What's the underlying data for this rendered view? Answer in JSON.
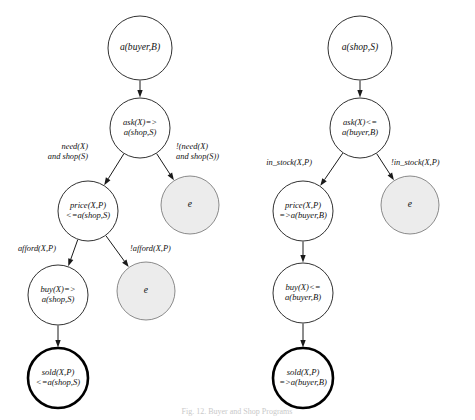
{
  "figure": {
    "caption": "Fig. 12. Buyer and Shop Programs",
    "width": 475,
    "height": 420,
    "background_color": "#ffffff",
    "stroke_color": "#1a1a1a",
    "shaded_fill_color": "#ececec",
    "accept_stroke_color": "#000000"
  },
  "trees": [
    {
      "id": "buyer-tree",
      "name": "buyer-protocol-tree",
      "nodes": [
        {
          "id": "buyer-root",
          "name": "node-a-buyer-b",
          "lines": [
            "a(buyer,B)"
          ],
          "cx": 140,
          "cy": 48,
          "r": 32,
          "style": "plain"
        },
        {
          "id": "buyer-ask",
          "name": "node-ask-x-to-a-shop-s",
          "lines": [
            "ask(X)=>",
            "a(shop,S)"
          ],
          "cx": 140,
          "cy": 128,
          "r": 30,
          "style": "plain"
        },
        {
          "id": "buyer-price",
          "name": "node-price-x-p-from-a-shop-s",
          "lines": [
            "price(X,P)",
            "<=a(shop,S)"
          ],
          "cx": 88,
          "cy": 211,
          "r": 30,
          "style": "plain"
        },
        {
          "id": "buyer-empty-1",
          "name": "node-empty-e-buyer-upper",
          "lines": [
            "e"
          ],
          "cx": 190,
          "cy": 205,
          "r": 29,
          "style": "shaded"
        },
        {
          "id": "buyer-buy",
          "name": "node-buy-x-to-a-shop-s",
          "lines": [
            "buy(X)=>",
            "a(shop,S)"
          ],
          "cx": 58,
          "cy": 295,
          "r": 30,
          "style": "plain"
        },
        {
          "id": "buyer-empty-2",
          "name": "node-empty-e-buyer-lower",
          "lines": [
            "e"
          ],
          "cx": 146,
          "cy": 291,
          "r": 29,
          "style": "shaded"
        },
        {
          "id": "buyer-sold",
          "name": "node-sold-x-p-from-a-shop-s",
          "lines": [
            "sold(X,P)",
            "<=a(shop,S)"
          ],
          "cx": 58,
          "cy": 378,
          "r": 30,
          "style": "accept"
        }
      ],
      "edges": [
        {
          "id": "buyer-e1",
          "name": "edge-root-to-ask",
          "from": "buyer-root",
          "to": "buyer-ask",
          "label_lines": [],
          "label_x": 0,
          "label_y": 0,
          "label_anchor": "middle"
        },
        {
          "id": "buyer-e2",
          "name": "edge-ask-to-price",
          "from": "buyer-ask",
          "to": "buyer-price",
          "label_lines": [
            "need(X)",
            "and shop(S)"
          ],
          "label_x": 88,
          "label_y": 152,
          "label_anchor": "end"
        },
        {
          "id": "buyer-e3",
          "name": "edge-ask-to-empty-1",
          "from": "buyer-ask",
          "to": "buyer-empty-1",
          "label_lines": [
            "!(need(X)",
            "and shop(S))"
          ],
          "label_x": 176,
          "label_y": 152,
          "label_anchor": "start"
        },
        {
          "id": "buyer-e4",
          "name": "edge-price-to-buy",
          "from": "buyer-price",
          "to": "buyer-buy",
          "label_lines": [
            "afford(X,P)"
          ],
          "label_x": 56,
          "label_y": 249,
          "label_anchor": "end"
        },
        {
          "id": "buyer-e5",
          "name": "edge-price-to-empty-2",
          "from": "buyer-price",
          "to": "buyer-empty-2",
          "label_lines": [
            "!afford(X,P)"
          ],
          "label_x": 130,
          "label_y": 249,
          "label_anchor": "start"
        },
        {
          "id": "buyer-e6",
          "name": "edge-buy-to-sold",
          "from": "buyer-buy",
          "to": "buyer-sold",
          "label_lines": [],
          "label_x": 0,
          "label_y": 0,
          "label_anchor": "middle"
        }
      ]
    },
    {
      "id": "shop-tree",
      "name": "shop-protocol-tree",
      "nodes": [
        {
          "id": "shop-root",
          "name": "node-a-shop-s",
          "lines": [
            "a(shop,S)"
          ],
          "cx": 360,
          "cy": 48,
          "r": 32,
          "style": "plain"
        },
        {
          "id": "shop-ask",
          "name": "node-ask-x-from-a-buyer-b",
          "lines": [
            "ask(X)<=",
            "a(buyer,B)"
          ],
          "cx": 360,
          "cy": 128,
          "r": 30,
          "style": "plain"
        },
        {
          "id": "shop-price",
          "name": "node-price-x-p-to-a-buyer-b",
          "lines": [
            "price(X,P)",
            "=>a(buyer,B)"
          ],
          "cx": 303,
          "cy": 211,
          "r": 30,
          "style": "plain"
        },
        {
          "id": "shop-empty-1",
          "name": "node-empty-e-shop",
          "lines": [
            "e"
          ],
          "cx": 410,
          "cy": 205,
          "r": 29,
          "style": "shaded"
        },
        {
          "id": "shop-buy",
          "name": "node-buy-x-from-a-buyer-b",
          "lines": [
            "buy(X)<=",
            "a(buyer,B)"
          ],
          "cx": 303,
          "cy": 293,
          "r": 30,
          "style": "plain"
        },
        {
          "id": "shop-sold",
          "name": "node-sold-x-p-to-a-buyer-b",
          "lines": [
            "sold(X,P)",
            "=>a(buyer,B)"
          ],
          "cx": 303,
          "cy": 378,
          "r": 30,
          "style": "accept"
        }
      ],
      "edges": [
        {
          "id": "shop-e1",
          "name": "edge-root-to-ask",
          "from": "shop-root",
          "to": "shop-ask",
          "label_lines": [],
          "label_x": 0,
          "label_y": 0,
          "label_anchor": "middle"
        },
        {
          "id": "shop-e2",
          "name": "edge-ask-to-price",
          "from": "shop-ask",
          "to": "shop-price",
          "label_lines": [
            "in_stock(X,P)"
          ],
          "label_x": 312,
          "label_y": 163,
          "label_anchor": "end"
        },
        {
          "id": "shop-e3",
          "name": "edge-ask-to-empty-1",
          "from": "shop-ask",
          "to": "shop-empty-1",
          "label_lines": [
            "!in_stock(X,P)"
          ],
          "label_x": 391,
          "label_y": 163,
          "label_anchor": "start"
        },
        {
          "id": "shop-e4",
          "name": "edge-price-to-buy",
          "from": "shop-price",
          "to": "shop-buy",
          "label_lines": [],
          "label_x": 0,
          "label_y": 0,
          "label_anchor": "middle"
        },
        {
          "id": "shop-e5",
          "name": "edge-buy-to-sold",
          "from": "shop-buy",
          "to": "shop-sold",
          "label_lines": [],
          "label_x": 0,
          "label_y": 0,
          "label_anchor": "middle"
        }
      ]
    }
  ]
}
